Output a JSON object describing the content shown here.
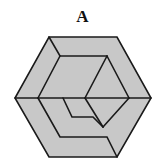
{
  "figure": {
    "label": "A",
    "fill_color": "#c8c8c8",
    "stroke_color": "#1a1a1a",
    "background": "#ffffff"
  }
}
